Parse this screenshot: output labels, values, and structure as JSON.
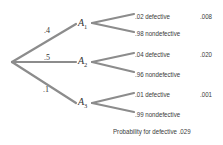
{
  "diagram": {
    "type": "probability-tree",
    "root_branches": [
      {
        "prob": ".4",
        "node": "A",
        "sub": "1",
        "outcomes": [
          {
            "prob": ".02",
            "label": "defective",
            "joint": ".008"
          },
          {
            "prob": ".98",
            "label": "nondefective",
            "joint": ""
          }
        ]
      },
      {
        "prob": ".5",
        "node": "A",
        "sub": "2",
        "outcomes": [
          {
            "prob": ".04",
            "label": "defective",
            "joint": ".020"
          },
          {
            "prob": ".96",
            "label": "nondefective",
            "joint": ""
          }
        ]
      },
      {
        "prob": ".1",
        "node": "A",
        "sub": "3",
        "outcomes": [
          {
            "prob": ".01",
            "label": "defective",
            "joint": ".001"
          },
          {
            "prob": ".99",
            "label": "nondefective",
            "joint": ""
          }
        ]
      }
    ],
    "total_label": "Probability for defective",
    "total_value": ".029",
    "line_color": "#8c8c8c",
    "text_color": "#3a3a3a"
  }
}
